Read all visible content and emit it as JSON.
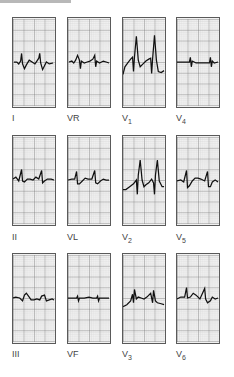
{
  "figure": {
    "layout": {
      "rows": 3,
      "columns": 4
    },
    "grid": {
      "major_cols": 4,
      "major_rows": 8,
      "minor_per_major": 5,
      "paper_color": "#f1f1f1",
      "major_line_color": "#6a6a6a",
      "minor_line_color": "#c4c4c4",
      "trace_color": "#111111"
    },
    "leads": [
      {
        "name": "I",
        "base": "I",
        "sub": ""
      },
      {
        "name": "VR",
        "base": "VR",
        "sub": ""
      },
      {
        "name": "V1",
        "base": "V",
        "sub": "1"
      },
      {
        "name": "V4",
        "base": "V",
        "sub": "4"
      },
      {
        "name": "II",
        "base": "II",
        "sub": ""
      },
      {
        "name": "VL",
        "base": "VL",
        "sub": ""
      },
      {
        "name": "V2",
        "base": "V",
        "sub": "2"
      },
      {
        "name": "V5",
        "base": "V",
        "sub": "5"
      },
      {
        "name": "III",
        "base": "III",
        "sub": ""
      },
      {
        "name": "VF",
        "base": "VF",
        "sub": ""
      },
      {
        "name": "V3",
        "base": "V",
        "sub": "3"
      },
      {
        "name": "V6",
        "base": "V",
        "sub": "6"
      }
    ]
  }
}
